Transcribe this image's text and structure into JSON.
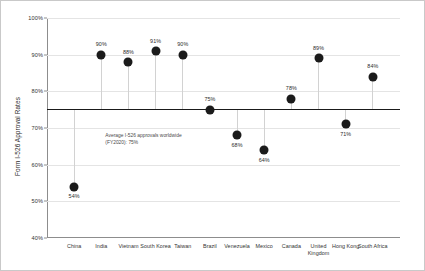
{
  "chart_data": {
    "type": "scatter",
    "title": "",
    "xlabel": "",
    "ylabel": "Form I-526 Approval Rates",
    "ylim": [
      40,
      100
    ],
    "ytick_labels": [
      "100%",
      "90%",
      "80%",
      "70%",
      "60%",
      "50%",
      "40%"
    ],
    "ytick_values": [
      100,
      90,
      80,
      70,
      60,
      50,
      40
    ],
    "grid": true,
    "legend": "none",
    "categories": [
      "China",
      "India",
      "Vietnam",
      "South Korea",
      "Taiwan",
      "Brazil",
      "Venezuela",
      "Mexico",
      "Canada",
      "United Kingdom",
      "Hong Kong",
      "South Africa"
    ],
    "values": [
      54,
      90,
      88,
      91,
      90,
      75,
      68,
      64,
      78,
      89,
      71,
      84
    ],
    "data_labels": [
      "54%",
      "90%",
      "88%",
      "91%",
      "90%",
      "75%",
      "68%",
      "64%",
      "78%",
      "89%",
      "71%",
      "84%"
    ],
    "label_positions": [
      "below",
      "above",
      "above",
      "above",
      "above",
      "above",
      "below",
      "below",
      "above",
      "above",
      "below",
      "above"
    ],
    "reference_line": {
      "value": 75,
      "annotation": "Average I-526 approvals worldwide (FY2020): 75%"
    },
    "colors": {
      "marker": "#1b1b1b",
      "stem": "#d2d2d2",
      "reference_line": "#1a1a1a",
      "grid": "#e4e4e4",
      "axis": "#8d8d8d",
      "text": "#333333",
      "background": "#ffffff"
    }
  }
}
